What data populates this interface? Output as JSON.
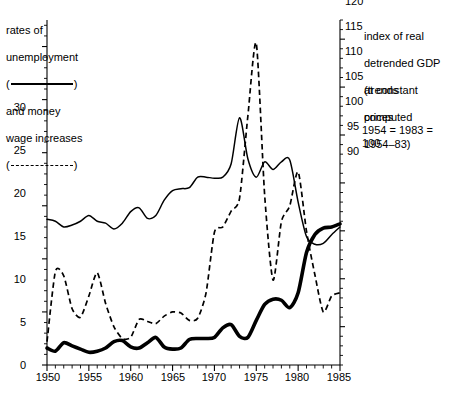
{
  "legend": {
    "left": {
      "line1": "rates of",
      "line2": "unemployment",
      "paren_open": "(",
      "paren_close": ")",
      "line4": "and money",
      "line5": "wage increases",
      "solid_sample_name": "solid-line-sample",
      "dashed_sample_name": "dashed-line-sample"
    },
    "right": {
      "line1": "index of real",
      "line2": "detrended GDP",
      "line3": "at constant",
      "line4": "prices",
      "line5": "(trends",
      "line6": "computed",
      "line7": "1954–83)",
      "line8": "1954 = 1983 = 100"
    }
  },
  "axes": {
    "left": {
      "title": "",
      "ticks": [
        "0",
        "5",
        "10",
        "15",
        "20",
        "25",
        "30"
      ],
      "min": 0,
      "max": 32.5,
      "minor_step": 1
    },
    "right": {
      "title": "",
      "ticks": [
        "90",
        "95",
        "100",
        "105",
        "110",
        "115",
        "120"
      ],
      "min": 86,
      "max": 122,
      "minor_step": 1
    },
    "bottom": {
      "ticks": [
        "1950",
        "1955",
        "1960",
        "1965",
        "1970",
        "1975",
        "1980",
        "1985"
      ],
      "min": 1950,
      "max": 1985,
      "minor_step": 1
    }
  },
  "colors": {
    "axis": "#000000",
    "unemployment": "#000000",
    "wage": "#000000",
    "gdp": "#000000",
    "background": "#ffffff"
  },
  "chart_data": {
    "type": "line",
    "title": "",
    "xlabel": "",
    "ylabel": "rates of unemployment and money wage increases",
    "y2label": "index of real detrended GDP at constant prices",
    "xlim": [
      1950,
      1985
    ],
    "ylim": [
      0,
      32.5
    ],
    "y2lim": [
      86,
      122
    ],
    "grid": false,
    "legend_position": "outside-top",
    "x": [
      1950,
      1951,
      1952,
      1953,
      1954,
      1955,
      1956,
      1957,
      1958,
      1959,
      1960,
      1961,
      1962,
      1963,
      1964,
      1965,
      1966,
      1967,
      1968,
      1969,
      1970,
      1971,
      1972,
      1973,
      1974,
      1975,
      1976,
      1977,
      1978,
      1979,
      1980,
      1981,
      1982,
      1983,
      1984,
      1985
    ],
    "series": [
      {
        "name": "rates of unemployment",
        "style": "solid-thick",
        "axis": "left",
        "units": "percent",
        "values": [
          1.6,
          1.3,
          2.1,
          1.8,
          1.5,
          1.2,
          1.3,
          1.6,
          2.2,
          2.3,
          1.7,
          1.6,
          2.1,
          2.6,
          1.7,
          1.5,
          1.6,
          2.4,
          2.5,
          2.5,
          2.6,
          3.5,
          3.8,
          2.7,
          2.6,
          4.2,
          5.7,
          6.2,
          6.1,
          5.4,
          6.8,
          10.6,
          12.3,
          12.9,
          13.0,
          13.3
        ],
        "note": "left-axis percent scale; values read from thick solid curve"
      },
      {
        "name": "money wage increases",
        "style": "dashed",
        "axis": "left",
        "units": "percent",
        "values": [
          2.2,
          8.8,
          8.4,
          5.3,
          4.5,
          6.5,
          8.7,
          5.8,
          3.6,
          2.5,
          2.6,
          4.3,
          4.1,
          3.9,
          4.6,
          5.0,
          4.9,
          4.2,
          4.4,
          6.8,
          12.5,
          13.0,
          14.5,
          15.7,
          23.5,
          30.3,
          16.0,
          8.0,
          13.5,
          15.0,
          18.2,
          12.6,
          8.5,
          5.0,
          6.5,
          6.8
        ],
        "note": "left-axis percent scale; values read from dashed curve"
      },
      {
        "name": "index of real detrended GDP at constant prices",
        "style": "solid-thin",
        "axis": "right",
        "units": "index (1954 = 1983 = 100)",
        "values": [
          101.2,
          101.0,
          100.4,
          100.6,
          101.0,
          101.6,
          101.0,
          100.8,
          100.2,
          100.8,
          102.0,
          102.4,
          101.3,
          101.6,
          103.2,
          104.2,
          104.4,
          104.5,
          105.6,
          105.6,
          105.5,
          105.6,
          107.0,
          111.8,
          107.5,
          105.6,
          107.2,
          106.4,
          107.2,
          107.4,
          103.0,
          99.4,
          98.6,
          98.7,
          99.6,
          100.4
        ],
        "note": "right-axis index scale; peak 1973 ≈ 112, trough 1982 ≈ 98.5"
      }
    ]
  }
}
